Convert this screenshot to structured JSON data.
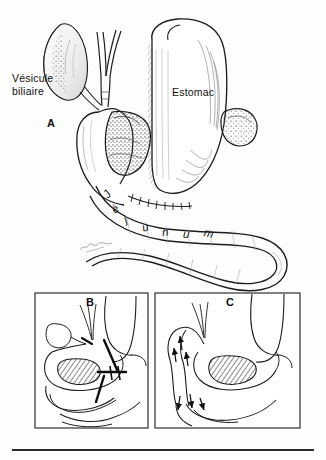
{
  "figure": {
    "title_visible": false,
    "background_color": "#fdfdfc",
    "ink_color": "#1a1a1a",
    "panels": [
      {
        "id": "A",
        "label": "A",
        "framed": false
      },
      {
        "id": "B",
        "label": "B",
        "framed": true
      },
      {
        "id": "C",
        "label": "C",
        "framed": true
      }
    ]
  },
  "labels": {
    "gallbladder_line1": "Vésicule",
    "gallbladder_line2": "biliaire",
    "stomach": "Estomac",
    "panel_a": "A",
    "panel_b": "B",
    "panel_c": "C"
  },
  "curved_label": {
    "text": "Jéjunum",
    "letters": [
      "J",
      "é",
      "j",
      "u",
      "n",
      "u",
      "m"
    ]
  },
  "anatomy": {
    "structures": [
      "gallbladder",
      "cystic-duct",
      "bile-duct-bifurcation",
      "duodenum",
      "pancreatic-tumor-mass",
      "stomach",
      "spleen",
      "jejunum-loop",
      "anastomosis-suture-line"
    ]
  },
  "panel_b_markers": {
    "transection_lines": 3,
    "tumor_shaded": true,
    "description_visible": false
  },
  "panel_c_markers": {
    "flow_arrows": 6,
    "tumor_hatched": true,
    "description_visible": false
  },
  "colors": {
    "ink": "#1a1a1a",
    "paper": "#fdfdfc",
    "tumor_fill": "#8d8d8d",
    "hatch": "#2a2a2a",
    "rule": "#2b2b2b"
  },
  "footer_rule": {
    "visible": true
  }
}
